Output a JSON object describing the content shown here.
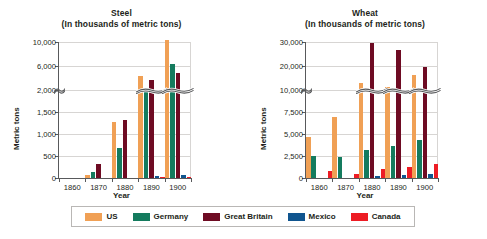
{
  "colors": {
    "us": "#F0A055",
    "germany": "#147B5E",
    "great_britain": "#6E0B23",
    "mexico": "#10558F",
    "canada": "#ED1C24",
    "axis": "#58595b",
    "grid": "#d7d5d3",
    "text": "#231f20"
  },
  "legend": {
    "items": [
      {
        "label": "US",
        "color_key": "us"
      },
      {
        "label": "Germany",
        "color_key": "germany"
      },
      {
        "label": "Great Britain",
        "color_key": "great_britain"
      },
      {
        "label": "Mexico",
        "color_key": "mexico"
      },
      {
        "label": "Canada",
        "color_key": "canada"
      }
    ]
  },
  "charts": {
    "steel": {
      "title_line1": "Steel",
      "title_line2": "(In thousands of metric tons)",
      "ylabel": "Metric tons",
      "xlabel": "Year",
      "yticks": [
        "0",
        "500",
        "1,000",
        "1,500",
        "2,000",
        "6,000",
        "10,000"
      ]
    },
    "wheat": {
      "title_line1": "Wheat",
      "title_line2": "(In thousands of metric tons)",
      "ylabel": "Metric tons",
      "xlabel": "Year",
      "yticks": [
        "0",
        "2,500",
        "5,000",
        "7,500",
        "10,000",
        "20,000",
        "30,000"
      ]
    }
  },
  "chart_data": [
    {
      "type": "bar",
      "id": "steel",
      "title": "Steel (In thousands of metric tons)",
      "xlabel": "Year",
      "ylabel": "Metric tons",
      "grid": true,
      "legend_position": "bottom",
      "axis_break": {
        "at": 2000,
        "note": "y axis is broken above 2,000; upper segment ticks 6,000 and 10,000"
      },
      "ytick_values": [
        0,
        500,
        1000,
        1500,
        2000,
        6000,
        10000
      ],
      "ytick_labels": [
        "0",
        "500",
        "1,000",
        "1,500",
        "2,000",
        "6,000",
        "10,000"
      ],
      "categories": [
        "1860",
        "1870",
        "1880",
        "1890",
        "1900"
      ],
      "series": [
        {
          "name": "US",
          "values": [
            0,
            70,
            1270,
            4300,
            10400
          ]
        },
        {
          "name": "Germany",
          "values": [
            0,
            130,
            690,
            2150,
            6400
          ]
        },
        {
          "name": "Great Britain",
          "values": [
            0,
            330,
            1330,
            3640,
            4900
          ]
        },
        {
          "name": "Mexico",
          "values": [
            0,
            0,
            0,
            50,
            60
          ]
        },
        {
          "name": "Canada",
          "values": [
            0,
            0,
            0,
            25,
            30
          ]
        }
      ]
    },
    {
      "type": "bar",
      "id": "wheat",
      "title": "Wheat (In thousands of metric tons)",
      "xlabel": "Year",
      "ylabel": "Metric tons",
      "grid": true,
      "legend_position": "bottom",
      "axis_break": {
        "at": 10000,
        "note": "y axis is broken above 10,000; upper segment ticks 20,000 and 30,000"
      },
      "ytick_values": [
        0,
        2500,
        5000,
        7500,
        10000,
        20000,
        30000
      ],
      "ytick_labels": [
        "0",
        "2,500",
        "5,000",
        "7,500",
        "10,000",
        "20,000",
        "30,000"
      ],
      "categories": [
        "1860",
        "1870",
        "1880",
        "1890",
        "1900"
      ],
      "series": [
        {
          "name": "US",
          "values": [
            4700,
            6900,
            13000,
            11500,
            16500
          ]
        },
        {
          "name": "Germany",
          "values": [
            2500,
            2450,
            3200,
            3700,
            4300
          ]
        },
        {
          "name": "Great Britain",
          "values": [
            0,
            0,
            29500,
            26500,
            19700
          ]
        },
        {
          "name": "Mexico",
          "values": [
            0,
            0,
            200,
            350,
            450
          ]
        },
        {
          "name": "Canada",
          "values": [
            800,
            500,
            1000,
            1250,
            1600
          ]
        }
      ]
    }
  ]
}
